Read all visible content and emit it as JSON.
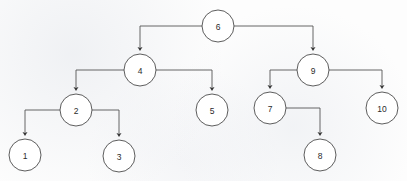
{
  "diagram": {
    "type": "binary-tree",
    "canvas": {
      "width": 407,
      "height": 181
    },
    "style": {
      "background_color": "#fdfdfd",
      "node_fill": "#ffffff",
      "node_stroke": "#4b4b4b",
      "edge_color": "#555555",
      "label_color": "#2b2b2b",
      "node_radius": 16
    },
    "root_label": "6",
    "nodes": [
      {
        "id": "n6",
        "label": "6",
        "cx": 218,
        "cy": 26,
        "r": 16,
        "depth": 0
      },
      {
        "id": "n4",
        "label": "4",
        "cx": 140,
        "cy": 70,
        "r": 16,
        "depth": 1
      },
      {
        "id": "n9",
        "label": "9",
        "cx": 313,
        "cy": 70,
        "r": 16,
        "depth": 1
      },
      {
        "id": "n2",
        "label": "2",
        "cx": 76,
        "cy": 110,
        "r": 16,
        "depth": 2
      },
      {
        "id": "n5",
        "label": "5",
        "cx": 212,
        "cy": 110,
        "r": 16,
        "depth": 2
      },
      {
        "id": "n7",
        "label": "7",
        "cx": 270,
        "cy": 108,
        "r": 16,
        "depth": 2
      },
      {
        "id": "n10",
        "label": "10",
        "cx": 382,
        "cy": 108,
        "r": 16,
        "depth": 2
      },
      {
        "id": "n1",
        "label": "1",
        "cx": 25,
        "cy": 155,
        "r": 16,
        "depth": 3
      },
      {
        "id": "n3",
        "label": "3",
        "cx": 119,
        "cy": 156,
        "r": 16,
        "depth": 3
      },
      {
        "id": "n8",
        "label": "8",
        "cx": 320,
        "cy": 155,
        "r": 16,
        "depth": 3
      }
    ],
    "edges": [
      {
        "id": "e6-4",
        "from": "6",
        "to": "4",
        "side": "left",
        "path": "M 202 26 L 140 26 L 140 48",
        "arrow_x": 140,
        "arrow_y": 50
      },
      {
        "id": "e6-9",
        "from": "6",
        "to": "9",
        "side": "right",
        "path": "M 234 26 L 313 26 L 313 48",
        "arrow_x": 313,
        "arrow_y": 50
      },
      {
        "id": "e4-2",
        "from": "4",
        "to": "2",
        "side": "left",
        "path": "M 124 70 L 76 70 L 76 88",
        "arrow_x": 76,
        "arrow_y": 90
      },
      {
        "id": "e4-5",
        "from": "4",
        "to": "5",
        "side": "right",
        "path": "M 156 70 L 212 70 L 212 88",
        "arrow_x": 212,
        "arrow_y": 90
      },
      {
        "id": "e9-7",
        "from": "9",
        "to": "7",
        "side": "left",
        "path": "M 297 70 L 270 70 L 270 86",
        "arrow_x": 270,
        "arrow_y": 88
      },
      {
        "id": "e9-10",
        "from": "9",
        "to": "10",
        "side": "right",
        "path": "M 329 70 L 382 70 L 382 86",
        "arrow_x": 382,
        "arrow_y": 88
      },
      {
        "id": "e2-1",
        "from": "2",
        "to": "1",
        "side": "left",
        "path": "M 60 110 L 25 110 L 25 133",
        "arrow_x": 25,
        "arrow_y": 135
      },
      {
        "id": "e2-3",
        "from": "2",
        "to": "3",
        "side": "right",
        "path": "M 92 110 L 119 110 L 119 134",
        "arrow_x": 119,
        "arrow_y": 136
      },
      {
        "id": "e7-8",
        "from": "7",
        "to": "8",
        "side": "right",
        "path": "M 286 108 L 320 108 L 320 133",
        "arrow_x": 320,
        "arrow_y": 135
      }
    ]
  }
}
